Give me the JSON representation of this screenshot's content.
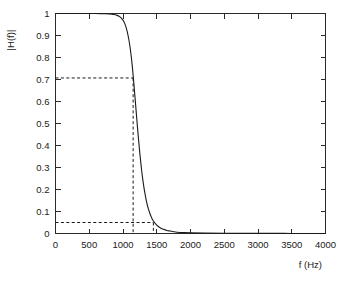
{
  "chart_data": {
    "type": "line",
    "title": "",
    "xlabel": "f (Hz)",
    "ylabel": "|H(f)|",
    "xlim": [
      0,
      4000
    ],
    "ylim": [
      0,
      1
    ],
    "grid": false,
    "legend": null,
    "x_ticks": [
      0,
      500,
      1000,
      1500,
      2000,
      2500,
      3000,
      3500,
      4000
    ],
    "x_tick_labels": [
      "0",
      "500",
      "1000",
      "1500",
      "2000",
      "2500",
      "3000",
      "3500",
      "4000"
    ],
    "y_ticks": [
      0,
      0.1,
      0.2,
      0.3,
      0.4,
      0.5,
      0.6,
      0.7,
      0.8,
      0.9,
      1
    ],
    "y_tick_labels": [
      "0",
      "0.1",
      "0.2",
      "0.3",
      "0.4",
      "0.5",
      "0.6",
      "0.7",
      "0.8",
      "0.9",
      "1"
    ],
    "series": [
      {
        "name": "|H(f)|",
        "x": [
          0,
          100,
          200,
          300,
          400,
          500,
          600,
          700,
          800,
          850,
          900,
          950,
          1000,
          1025,
          1050,
          1075,
          1100,
          1125,
          1150,
          1175,
          1200,
          1225,
          1250,
          1275,
          1300,
          1325,
          1350,
          1375,
          1400,
          1425,
          1450,
          1500,
          1550,
          1600,
          1650,
          1700,
          1750,
          1800,
          1900,
          2000,
          2200,
          2500,
          3000,
          3500,
          4000
        ],
        "y": [
          1.0,
          1.0,
          1.0,
          1.0,
          1.0,
          1.0,
          1.0,
          0.999,
          0.998,
          0.996,
          0.993,
          0.986,
          0.97,
          0.955,
          0.932,
          0.9,
          0.857,
          0.797,
          0.72,
          0.63,
          0.536,
          0.445,
          0.362,
          0.29,
          0.23,
          0.182,
          0.143,
          0.113,
          0.09,
          0.071,
          0.057,
          0.038,
          0.026,
          0.019,
          0.014,
          0.011,
          0.008,
          0.006,
          0.004,
          0.003,
          0.002,
          0.001,
          0.0005,
          0.0003,
          0.0002
        ]
      }
    ],
    "annotations": [
      {
        "name": "cutoff-3db-guide",
        "type": "dashed-guide",
        "y_value": 0.707,
        "x_value": 1150,
        "description": "horizontal dashed line at |H(f)| = 0.707 meeting curve, with vertical dashed drop to axis"
      },
      {
        "name": "stopband-guide",
        "type": "dashed-guide",
        "y_value": 0.05,
        "x_value": 1450,
        "description": "horizontal dashed line at |H(f)| = 0.05 meeting curve, with short vertical dashed drop to axis"
      }
    ]
  }
}
